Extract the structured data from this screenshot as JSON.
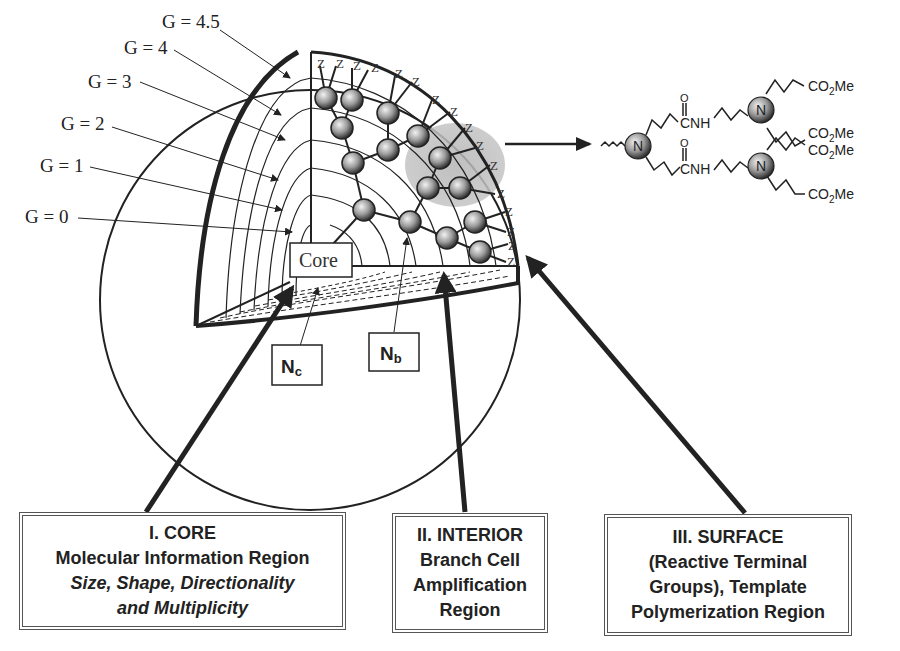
{
  "figure": {
    "generation_labels": [
      {
        "label": "G = 4.5",
        "x": 162,
        "y": 28
      },
      {
        "label": "G = 4",
        "x": 124,
        "y": 54
      },
      {
        "label": "G = 3",
        "x": 88,
        "y": 88
      },
      {
        "label": "G = 2",
        "x": 61,
        "y": 130
      },
      {
        "label": "G = 1",
        "x": 40,
        "y": 172
      },
      {
        "label": "G = 0",
        "x": 25,
        "y": 223
      }
    ],
    "core_label": "Core",
    "terminal_group_symbol": "Z",
    "nc_box": {
      "main": "N",
      "sub": "c"
    },
    "nb_box": {
      "main": "N",
      "sub": "b"
    },
    "colors": {
      "line": "#222222",
      "highlight": "#b8b8b8",
      "sphere_light": "#e8e8e8",
      "sphere_dark": "#333333"
    }
  },
  "chemical_structure": {
    "nitrogen_symbol": "N",
    "amide_oxygen": "O",
    "amide_label": "CNH",
    "ester_label_prefix": "CO",
    "ester_label_sub": "2",
    "ester_label_suffix": "Me"
  },
  "regions": [
    {
      "title": "I. CORE",
      "lines": [
        "Molecular Information Region"
      ],
      "italic_lines": [
        "Size, Shape, Directionality",
        "and Multiplicity"
      ]
    },
    {
      "title": "II. INTERIOR",
      "lines": [
        "Branch Cell",
        "Amplification",
        "Region"
      ],
      "italic_lines": []
    },
    {
      "title": "III. SURFACE",
      "lines": [
        "(Reactive Terminal",
        "Groups), Template",
        "Polymerization Region"
      ],
      "italic_lines": []
    }
  ]
}
